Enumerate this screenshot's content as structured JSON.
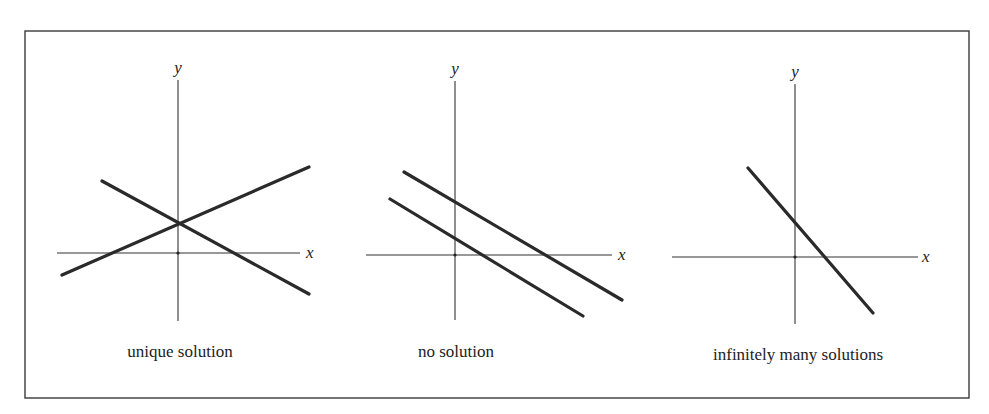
{
  "figure": {
    "frame": {
      "x": 25,
      "y": 31,
      "width": 944,
      "height": 367,
      "color": "#3a3a3a"
    },
    "line_color": "#2a2a2a",
    "panels": [
      {
        "id": "unique",
        "caption": "unique solution",
        "caption_pos": {
          "x": 180,
          "y": 357
        },
        "x_axis": {
          "x1": 57,
          "x2": 300,
          "y": 253,
          "label": "x",
          "label_pos": {
            "x": 306,
            "y": 258
          }
        },
        "y_axis": {
          "x": 178,
          "y1": 80,
          "y2": 321,
          "label": "y",
          "label_pos": {
            "x": 178,
            "y": 73
          }
        },
        "lines": [
          {
            "x1": 62,
            "y1": 275,
            "x2": 309,
            "y2": 167
          },
          {
            "x1": 102,
            "y1": 181,
            "x2": 309,
            "y2": 294
          }
        ]
      },
      {
        "id": "none",
        "caption": "no solution",
        "caption_pos": {
          "x": 456,
          "y": 357
        },
        "x_axis": {
          "x1": 366,
          "x2": 612,
          "y": 255,
          "label": "x",
          "label_pos": {
            "x": 618,
            "y": 260
          }
        },
        "y_axis": {
          "x": 455,
          "y1": 81,
          "y2": 320,
          "label": "y",
          "label_pos": {
            "x": 455,
            "y": 74
          }
        },
        "lines": [
          {
            "x1": 404,
            "y1": 172,
            "x2": 622,
            "y2": 300
          },
          {
            "x1": 390,
            "y1": 199,
            "x2": 583,
            "y2": 316
          }
        ]
      },
      {
        "id": "infinite",
        "caption": "infinitely many solutions",
        "caption_pos": {
          "x": 798,
          "y": 360
        },
        "x_axis": {
          "x1": 672,
          "x2": 918,
          "y": 257,
          "label": "x",
          "label_pos": {
            "x": 922,
            "y": 262
          }
        },
        "y_axis": {
          "x": 795,
          "y1": 84,
          "y2": 324,
          "label": "y",
          "label_pos": {
            "x": 795,
            "y": 77
          }
        },
        "lines": [
          {
            "x1": 748,
            "y1": 168,
            "x2": 873,
            "y2": 313
          }
        ]
      }
    ]
  }
}
